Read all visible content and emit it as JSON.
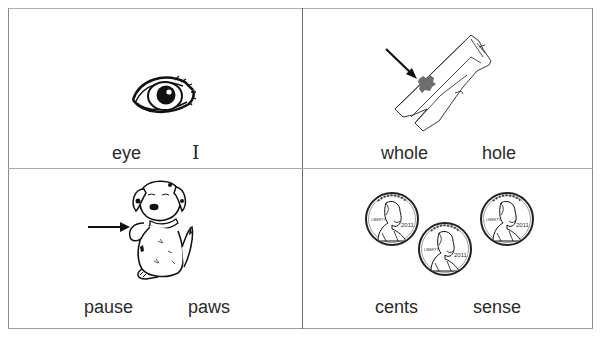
{
  "worksheet": {
    "type": "homophone picture cards",
    "cells": [
      {
        "id": "eye",
        "picture": "eye-icon",
        "words": [
          "eye",
          "I"
        ]
      },
      {
        "id": "hole",
        "picture": "torn-pants-icon",
        "pointer": "arrow pointing to hole",
        "words": [
          "whole",
          "hole"
        ]
      },
      {
        "id": "paws",
        "picture": "puppy-icon",
        "pointer": "arrow pointing to paw",
        "words": [
          "pause",
          "paws"
        ]
      },
      {
        "id": "cents",
        "picture": "pennies-icon",
        "coin_year": "2011",
        "coin_inscription": "LIBERTY",
        "words": [
          "cents",
          "sense"
        ]
      }
    ]
  },
  "colors": {
    "border": "#8a8a8a",
    "text": "#2a2a2a",
    "ink": "#111111",
    "hole_fill": "#6e6e6e"
  }
}
